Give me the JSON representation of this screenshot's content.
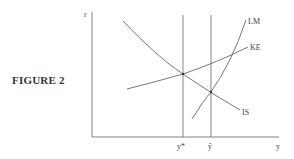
{
  "figure": {
    "label": "FIGURE 2",
    "axes": {
      "y_label": "r",
      "x_label": "y"
    },
    "curves": [
      {
        "name": "IS",
        "label": "IS"
      },
      {
        "name": "KE",
        "label": "KE"
      },
      {
        "name": "LM",
        "label": "LM"
      }
    ],
    "vertical_lines": [
      {
        "name": "y-star",
        "label": "y*"
      },
      {
        "name": "y-hat",
        "label": "ŷ"
      }
    ],
    "colors": {
      "line": "#555555",
      "axis": "#666666",
      "text": "#333333"
    }
  }
}
